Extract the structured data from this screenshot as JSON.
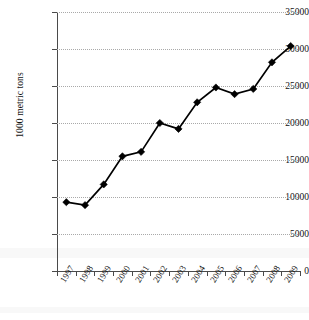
{
  "chart_data": {
    "type": "line",
    "title": "",
    "xlabel": "",
    "ylabel": "1000 metric tons",
    "categories": [
      "1997",
      "1998",
      "1999",
      "2000",
      "2001",
      "2002",
      "2003",
      "2004",
      "2005",
      "2006",
      "2007",
      "2008",
      "2009"
    ],
    "values": [
      9300,
      8900,
      11700,
      15500,
      16100,
      20000,
      19200,
      22800,
      24800,
      23900,
      24600,
      28200,
      30400
    ],
    "series": [
      {
        "name": "1000 metric tons",
        "values": [
          9300,
          8900,
          11700,
          15500,
          16100,
          20000,
          19200,
          22800,
          24800,
          23900,
          24600,
          28200,
          30400
        ]
      }
    ],
    "ylim": [
      0,
      35000
    ],
    "y_ticks": [
      0,
      5000,
      10000,
      15000,
      20000,
      25000,
      30000,
      35000
    ],
    "y_tick_labels": [
      "0",
      "5000",
      "10000",
      "15000",
      "20000",
      "25000",
      "30000",
      "35000"
    ],
    "x_tick_labels": [
      "1997",
      "1998",
      "1999",
      "2000",
      "2001",
      "2002",
      "2003",
      "2004",
      "2005",
      "2006",
      "2007",
      "2008",
      "2009"
    ],
    "grid": "horizontal-dotted",
    "legend": "none",
    "marker": "diamond",
    "line_color": "#000000",
    "marker_color": "#000000",
    "grid_color": "#a9a9a9",
    "background_color": "#ffffff"
  }
}
